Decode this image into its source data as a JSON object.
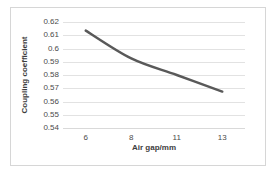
{
  "chart_data": {
    "type": "line",
    "title": "",
    "xlabel": "Air gap/mm",
    "ylabel": "Coupling coefficient",
    "categories": [
      "6",
      "8",
      "11",
      "13"
    ],
    "values": [
      0.6135,
      0.5925,
      0.58,
      0.5675
    ],
    "series": [
      {
        "name": "Coupling coefficient",
        "values": [
          0.6135,
          0.5925,
          0.58,
          0.5675
        ],
        "color": "#595959",
        "line_width": 2.5,
        "markers": false,
        "smooth": true
      }
    ],
    "ylim": [
      0.54,
      0.62
    ],
    "yticks": [
      "0.54",
      "0.55",
      "0.56",
      "0.57",
      "0.58",
      "0.59",
      "0.6",
      "0.61",
      "0.62"
    ],
    "ytick_values": [
      0.54,
      0.55,
      0.56,
      0.57,
      0.58,
      0.59,
      0.6,
      0.61,
      0.62
    ],
    "xticks": [
      "6",
      "8",
      "11",
      "13"
    ],
    "grid": "horizontal",
    "legend": "none",
    "plot_background": "#ffffff",
    "gridline_color": "#e2e2e2",
    "border_color": "#d6d6d6",
    "tick_label_color": "#4a4a4a",
    "axis_title_color": "#3d3d3d"
  }
}
